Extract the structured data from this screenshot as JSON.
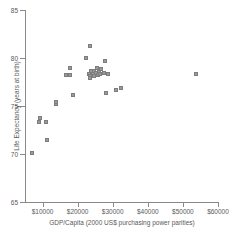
{
  "chart_data": {
    "type": "scatter",
    "title": "",
    "xlabel": "GDP/Capita (2000 US$ purchasing power parities)",
    "ylabel": "Life Expectancy (years at birth)",
    "xlim": [
      5000,
      60000
    ],
    "ylim": [
      65,
      85
    ],
    "xticks": [
      10000,
      20000,
      30000,
      40000,
      50000,
      60000
    ],
    "xticklabels": [
      "$10000",
      "$20000",
      "$30000",
      "$40000",
      "$50000",
      "$60000"
    ],
    "yticks": [
      65,
      70,
      75,
      80,
      85
    ],
    "yticklabels": [
      "65",
      "70",
      "75",
      "80",
      "85"
    ],
    "grid": false,
    "legend": null,
    "marker": "square",
    "marker_color": "#9a9a9a",
    "points": [
      {
        "x": 7000,
        "y": 70.1
      },
      {
        "x": 9000,
        "y": 73.3
      },
      {
        "x": 9400,
        "y": 73.7
      },
      {
        "x": 10900,
        "y": 73.3
      },
      {
        "x": 11400,
        "y": 71.5
      },
      {
        "x": 13900,
        "y": 75.2
      },
      {
        "x": 13900,
        "y": 75.4
      },
      {
        "x": 16800,
        "y": 78.2
      },
      {
        "x": 17700,
        "y": 78.2
      },
      {
        "x": 17900,
        "y": 79.0
      },
      {
        "x": 18700,
        "y": 76.1
      },
      {
        "x": 22300,
        "y": 80.0
      },
      {
        "x": 23500,
        "y": 81.3
      },
      {
        "x": 23100,
        "y": 78.3
      },
      {
        "x": 23400,
        "y": 78.1
      },
      {
        "x": 23600,
        "y": 77.9
      },
      {
        "x": 23900,
        "y": 78.6
      },
      {
        "x": 24300,
        "y": 78.3
      },
      {
        "x": 24600,
        "y": 78.1
      },
      {
        "x": 24800,
        "y": 78.6
      },
      {
        "x": 25100,
        "y": 78.4
      },
      {
        "x": 25400,
        "y": 79.0
      },
      {
        "x": 25700,
        "y": 78.2
      },
      {
        "x": 26000,
        "y": 78.5
      },
      {
        "x": 26300,
        "y": 78.3
      },
      {
        "x": 26700,
        "y": 78.9
      },
      {
        "x": 27400,
        "y": 78.4
      },
      {
        "x": 27900,
        "y": 79.7
      },
      {
        "x": 28700,
        "y": 78.3
      },
      {
        "x": 28000,
        "y": 76.4
      },
      {
        "x": 30900,
        "y": 76.7
      },
      {
        "x": 32300,
        "y": 76.9
      },
      {
        "x": 53700,
        "y": 78.3
      }
    ]
  }
}
